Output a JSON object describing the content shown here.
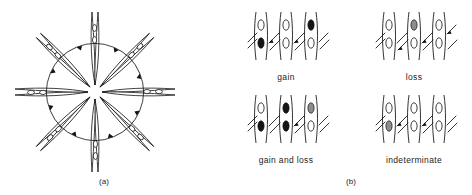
{
  "figure": {
    "background_color": "#ffffff",
    "ink_color": "#111111",
    "panels": [
      {
        "id": "panel-a",
        "label": "(a)",
        "kind": "radial-spindle-diagram",
        "description": "Eight spindle-shaped elongated cells arranged radially around a central hub, each containing two oval nuclei, with curved arc arrows running counterclockwise between adjacent spokes.",
        "spoke_count": 8,
        "nuclei_per_spoke": 2,
        "arc_count": 8,
        "arrow_direction": "counterclockwise"
      },
      {
        "id": "panel-b",
        "label": "(b)",
        "kind": "four-case-grid",
        "columns_per_case": 3,
        "nuclei_per_column": 2,
        "cases": [
          {
            "id": "case-gain",
            "label": "gain",
            "columns": [
              {
                "nuclei": [
                  "open",
                  "filled"
                ]
              },
              {
                "nuclei": [
                  "open",
                  "open"
                ]
              },
              {
                "nuclei": [
                  "filled",
                  "open"
                ]
              }
            ]
          },
          {
            "id": "case-loss",
            "label": "loss",
            "columns": [
              {
                "nuclei": [
                  "open",
                  "open"
                ]
              },
              {
                "nuclei": [
                  "stippled",
                  "open"
                ]
              },
              {
                "nuclei": [
                  "open",
                  "open"
                ]
              }
            ]
          },
          {
            "id": "case-gain-and-loss",
            "label": "gain and loss",
            "columns": [
              {
                "nuclei": [
                  "open",
                  "filled"
                ]
              },
              {
                "nuclei": [
                  "filled",
                  "filled"
                ]
              },
              {
                "nuclei": [
                  "stippled",
                  "open"
                ]
              }
            ]
          },
          {
            "id": "case-indeterminate",
            "label": "indeterminate",
            "columns": [
              {
                "nuclei": [
                  "open",
                  "stippled"
                ]
              },
              {
                "nuclei": [
                  "open",
                  "open"
                ]
              },
              {
                "nuclei": [
                  "open",
                  "open"
                ]
              }
            ]
          }
        ]
      }
    ]
  }
}
